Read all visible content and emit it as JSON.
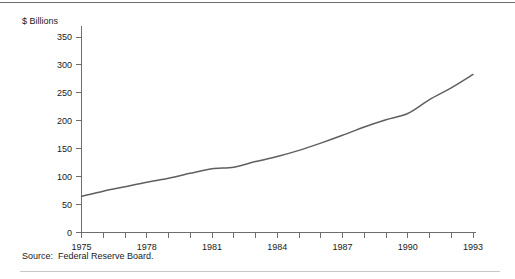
{
  "chart_data": {
    "type": "line",
    "title": "",
    "xlabel": "",
    "ylabel": "$ Billions",
    "ylim": [
      0,
      350
    ],
    "xlim": [
      1975,
      1993
    ],
    "grid": false,
    "legend": false,
    "y_ticks": [
      0,
      50,
      100,
      150,
      200,
      250,
      300,
      350
    ],
    "y_tick_labels": [
      "0",
      "50",
      "100",
      "150",
      "200",
      "250",
      "300",
      "350"
    ],
    "x_ticks": [
      1975,
      1976,
      1977,
      1978,
      1979,
      1980,
      1981,
      1982,
      1983,
      1984,
      1985,
      1986,
      1987,
      1988,
      1989,
      1990,
      1991,
      1992,
      1993
    ],
    "x_tick_labels_shown": [
      "1975",
      "1978",
      "1981",
      "1984",
      "1987",
      "1990",
      "1993"
    ],
    "x_labeled_ticks": [
      1975,
      1978,
      1981,
      1984,
      1987,
      1990,
      1993
    ],
    "series": [
      {
        "name": "$ Billions",
        "color": "#5f5f5f",
        "x": [
          1975,
          1976,
          1977,
          1978,
          1979,
          1980,
          1981,
          1982,
          1983,
          1984,
          1985,
          1986,
          1987,
          1988,
          1989,
          1990,
          1991,
          1992,
          1993
        ],
        "values": [
          65,
          74,
          82,
          90,
          97,
          106,
          114,
          117,
          127,
          136,
          147,
          160,
          174,
          189,
          202,
          213,
          238,
          259,
          283
        ]
      }
    ],
    "source": "Federal Reserve Board."
  },
  "labels": {
    "y_axis_unit": "$ Billions",
    "source_prefix": "Source:",
    "source_text": "Federal Reserve Board."
  },
  "colors": {
    "line": "#5f5f5f",
    "axis": "#6e6e6e",
    "text": "#1a1a1a",
    "top_rule": "#6e6e6e",
    "bottom_rule": "#c8c8c8",
    "background": "#ffffff"
  }
}
